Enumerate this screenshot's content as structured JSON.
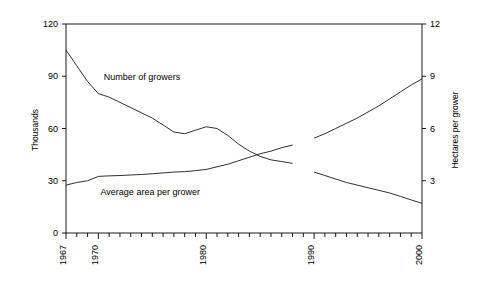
{
  "chart_data": {
    "type": "line",
    "title": "",
    "xlabel": "",
    "ylabel": "Thousands",
    "y2label": "Hectares per grower",
    "xlim": [
      1967,
      2000
    ],
    "ylim": [
      0,
      120
    ],
    "y2lim": [
      0,
      12
    ],
    "grid": false,
    "legend_position": "inline-annotation",
    "x_ticks_major": [
      "1967",
      "1970",
      "1980",
      "1990",
      "2000"
    ],
    "x_ticks_major_values": [
      1967,
      1970,
      1980,
      1990,
      2000
    ],
    "x_ticks_minor_step": 1,
    "y_ticks_left": [
      "0",
      "30",
      "60",
      "90",
      "120"
    ],
    "y_ticks_left_values": [
      0,
      30,
      60,
      90,
      120
    ],
    "y_ticks_right": [
      "3",
      "6",
      "9",
      "12"
    ],
    "y_ticks_right_values": [
      3,
      6,
      9,
      12
    ],
    "series": [
      {
        "name": "Number of growers",
        "axis": "left",
        "units": "thousands",
        "label_text": "Number of growers",
        "x": [
          1967,
          1968,
          1969,
          1970,
          1971,
          1972,
          1973,
          1974,
          1975,
          1976,
          1977,
          1978,
          1979,
          1980,
          1981,
          1982,
          1983,
          1984,
          1985,
          1986,
          1987,
          1988,
          1990,
          1991,
          1992,
          1993,
          1994,
          1995,
          1996,
          1997,
          1998,
          1999,
          2000
        ],
        "values": [
          105,
          96,
          87,
          80,
          78,
          75,
          72,
          69,
          66,
          62,
          58,
          57,
          59,
          61,
          60,
          56,
          51,
          47,
          44,
          42,
          41,
          40,
          35,
          33,
          31,
          29,
          27.5,
          26,
          24.5,
          23,
          21,
          19,
          17
        ],
        "break_after_year": 1988,
        "break_resume_year": 1990
      },
      {
        "name": "Average area per grower",
        "axis": "right",
        "units": "hectares per grower",
        "label_text": "Average area per grower",
        "x": [
          1967,
          1968,
          1969,
          1970,
          1971,
          1972,
          1973,
          1974,
          1975,
          1976,
          1977,
          1978,
          1979,
          1980,
          1981,
          1982,
          1983,
          1984,
          1985,
          1986,
          1987,
          1988,
          1990,
          1991,
          1992,
          1993,
          1994,
          1995,
          1996,
          1997,
          1998,
          1999,
          2000
        ],
        "values": [
          2.75,
          2.9,
          3.0,
          3.25,
          3.28,
          3.3,
          3.33,
          3.36,
          3.4,
          3.45,
          3.5,
          3.52,
          3.58,
          3.65,
          3.8,
          3.95,
          4.15,
          4.35,
          4.55,
          4.7,
          4.9,
          5.05,
          5.45,
          5.7,
          6.0,
          6.3,
          6.6,
          6.95,
          7.3,
          7.7,
          8.1,
          8.5,
          8.85
        ],
        "break_after_year": 1988,
        "break_resume_year": 1990
      }
    ],
    "annotations": [
      {
        "text": "Number of growers",
        "x": 1970.5,
        "y": 88
      },
      {
        "text": "Average area per grower",
        "x": 1970.2,
        "y": 22
      }
    ],
    "colors": {
      "line": "#1a1a1a",
      "axis": "#000000",
      "background": "#ffffff"
    }
  }
}
